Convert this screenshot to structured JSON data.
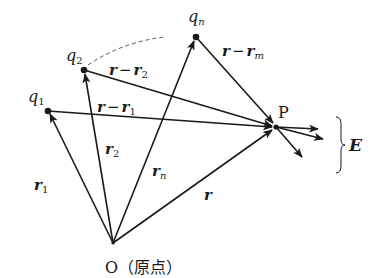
{
  "diagram": {
    "colors": {
      "stroke": "#1a1a1a",
      "dashed": "#555555",
      "background": "#ffffff"
    },
    "points": {
      "origin": {
        "label": "O",
        "annotation": "（原点）",
        "x": 113,
        "y": 243
      },
      "P": {
        "label": "P",
        "x": 276,
        "y": 127
      },
      "q1": {
        "label_base": "q",
        "label_sub": "1",
        "x": 48,
        "y": 111
      },
      "q2": {
        "label_base": "q",
        "label_sub": "2",
        "x": 84,
        "y": 70
      },
      "qn": {
        "label_base": "q",
        "label_sub": "n",
        "x": 196,
        "y": 37
      }
    },
    "position_vectors": [
      {
        "name": "r1",
        "base": "r",
        "sub": "1",
        "from": "origin",
        "to": "q1"
      },
      {
        "name": "r2",
        "base": "r",
        "sub": "2",
        "from": "origin",
        "to": "q2"
      },
      {
        "name": "rn",
        "base": "r",
        "sub": "n",
        "from": "origin",
        "to": "qn"
      },
      {
        "name": "r",
        "base": "r",
        "sub": "",
        "from": "origin",
        "to": "P"
      }
    ],
    "displacement_vectors": [
      {
        "name": "r-r1",
        "text_a": "r",
        "op": "−",
        "text_b": "r",
        "sub": "1",
        "from": "q1",
        "to": "P"
      },
      {
        "name": "r-r2",
        "text_a": "r",
        "op": "−",
        "text_b": "r",
        "sub": "2",
        "from": "q2",
        "to": "P"
      },
      {
        "name": "r-rm",
        "text_a": "r",
        "op": "−",
        "text_b": "r",
        "sub": "m",
        "from": "qn",
        "to": "P"
      }
    ],
    "field_vectors": {
      "count": 3,
      "brace_label": "E"
    },
    "dashed_arc": {
      "from": "q2",
      "toward": "qn",
      "meaning": "more charges between q2 and qn"
    }
  }
}
